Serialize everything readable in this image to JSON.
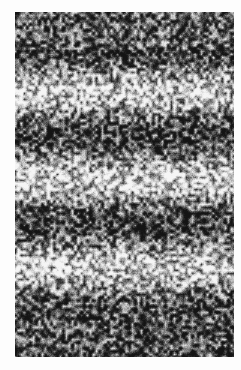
{
  "image": {
    "description": "Grayscale laser speckle pattern with horizontal interference fringes",
    "background_color": "#fdfdfd",
    "frame": {
      "x": 15,
      "y": 12,
      "width": 219,
      "height": 345
    },
    "fringes": {
      "orientation": "horizontal",
      "band_centers_y": [
        {
          "y": 50,
          "tone": "dark"
        },
        {
          "y": 92,
          "tone": "light"
        },
        {
          "y": 135,
          "tone": "dark"
        },
        {
          "y": 180,
          "tone": "light"
        },
        {
          "y": 222,
          "tone": "dark"
        },
        {
          "y": 268,
          "tone": "light"
        },
        {
          "y": 312,
          "tone": "dark"
        }
      ]
    }
  }
}
